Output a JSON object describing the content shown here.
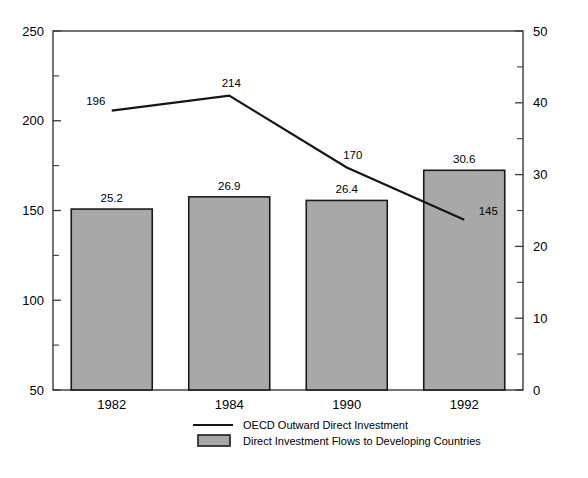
{
  "chart_data": {
    "type": "bar",
    "title": "",
    "subtitle": "",
    "xlabel": "",
    "ylabel": "",
    "categories": [
      "1982",
      "1984",
      "1990",
      "1992"
    ],
    "grid": false,
    "legend_position": "bottom",
    "axes": {
      "left": {
        "label": "",
        "min": 50,
        "max": 250,
        "ticks": [
          50,
          100,
          150,
          200,
          250
        ],
        "tick_labels": [
          "50",
          "100",
          "150",
          "200",
          "250"
        ],
        "minor_ticks": [
          75,
          125,
          175,
          225
        ]
      },
      "right": {
        "label": "",
        "min": 0,
        "max": 50,
        "ticks": [
          0,
          10,
          20,
          30,
          40,
          50
        ],
        "tick_labels": [
          "0",
          "10",
          "20",
          "30",
          "40",
          "50"
        ],
        "minor_ticks": [
          5,
          15,
          25,
          35,
          45
        ]
      }
    },
    "series": [
      {
        "name": "OECD Outward Direct Investment",
        "type": "line",
        "axis": "right",
        "color": "#151515",
        "values": [
          38.9,
          41.0,
          31.0,
          23.7
        ],
        "data_labels": [
          "196",
          "214",
          "170",
          "145"
        ],
        "label_offsets": [
          {
            "dx": -16,
            "dy": -6
          },
          {
            "dx": 2,
            "dy": -9
          },
          {
            "dx": 6,
            "dy": -8
          },
          {
            "dx": 24,
            "dy": -5
          }
        ]
      },
      {
        "name": "Direct Investment Flows to Developing Countries",
        "type": "bar",
        "axis": "right",
        "color": "#a8a8a8",
        "values": [
          25.2,
          26.9,
          26.4,
          30.6
        ],
        "data_labels": [
          "25.2",
          "26.9",
          "26.4",
          "30.6"
        ]
      }
    ]
  },
  "legend": {
    "items": [
      {
        "label": "OECD Outward Direct Investment",
        "marker": "line"
      },
      {
        "label": "Direct Investment Flows to Developing Countries",
        "marker": "box"
      }
    ]
  },
  "colors": {
    "bar_fill": "#a8a8a8",
    "bar_stroke": "#1a1a1a",
    "line": "#151515",
    "frame": "#3a3a3a",
    "background": "#ffffff"
  }
}
